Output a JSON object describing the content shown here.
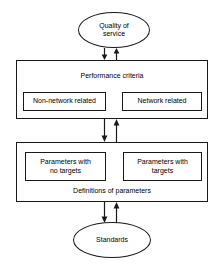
{
  "diagram": {
    "colors": {
      "stroke": "#1a1a1a",
      "background": "#ffffff",
      "text": "#000000"
    },
    "nodes": {
      "quality_of_service": {
        "label": "Quality of\nservice",
        "shape": "ellipse"
      },
      "performance_criteria": {
        "label": "Performance criteria",
        "shape": "rectangle",
        "children": [
          {
            "label": "Non-network related",
            "shape": "rectangle"
          },
          {
            "label": "Network related",
            "shape": "rectangle"
          }
        ]
      },
      "definitions_of_parameters": {
        "label": "Definitions of parameters",
        "shape": "rectangle",
        "children": [
          {
            "label": "Parameters with\nno targets",
            "shape": "rectangle"
          },
          {
            "label": "Parameters with\ntargets",
            "shape": "rectangle"
          }
        ]
      },
      "standards": {
        "label": "Standards",
        "shape": "ellipse"
      }
    },
    "connectors": [
      {
        "name": "qos-to-performance",
        "from": "quality_of_service",
        "to": "performance_criteria",
        "style": "bidirectional-pair",
        "down_arrow": "↓",
        "up_arrow": "↑"
      },
      {
        "name": "performance-to-definitions",
        "from": "performance_criteria",
        "to": "definitions_of_parameters",
        "style": "bidirectional-pair",
        "down_arrow": "↓",
        "up_arrow": "↑"
      },
      {
        "name": "definitions-to-standards",
        "from": "definitions_of_parameters",
        "to": "standards",
        "style": "bidirectional-pair",
        "down_arrow": "↓",
        "up_arrow": "↑"
      }
    ]
  }
}
